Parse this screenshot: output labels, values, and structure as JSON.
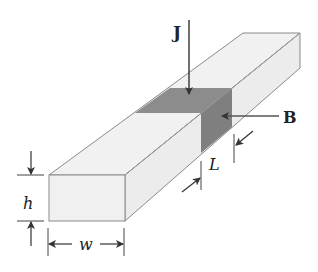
{
  "diagram": {
    "labels": {
      "current_density": "J",
      "magnetic_field": "B",
      "height": "h",
      "width": "w",
      "length": "L"
    },
    "colors": {
      "bar_fill": "#f1f1f1",
      "bar_side_fill": "#ececec",
      "edge": "#8a8a8a",
      "shaded_region": "#8c8c8c",
      "shaded_side": "#7f7f7f",
      "arrow": "#333333"
    }
  }
}
